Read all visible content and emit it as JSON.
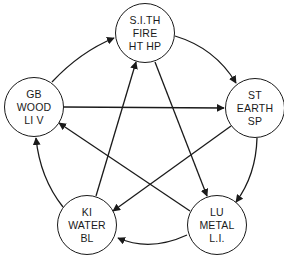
{
  "diagram": {
    "type": "five-element-cycle",
    "colors": {
      "stroke": "#1a1a1a",
      "background": "#ffffff"
    },
    "nodes": [
      {
        "id": "fire",
        "lines": [
          "S.I.TH",
          "FIRE",
          "HT HP"
        ],
        "cx": 145,
        "cy": 33,
        "r": 30
      },
      {
        "id": "earth",
        "lines": [
          "ST",
          "EARTH",
          "SP"
        ],
        "cx": 255,
        "cy": 108,
        "r": 30
      },
      {
        "id": "metal",
        "lines": [
          "LU",
          "METAL",
          "L.I."
        ],
        "cx": 217,
        "cy": 225,
        "r": 30
      },
      {
        "id": "water",
        "lines": [
          "KI",
          "WATER",
          "BL"
        ],
        "cx": 87,
        "cy": 225,
        "r": 30
      },
      {
        "id": "wood",
        "lines": [
          "GB",
          "WOOD",
          "LI V"
        ],
        "cx": 34,
        "cy": 107,
        "r": 30
      }
    ],
    "edges": [
      {
        "from": "wood",
        "to": "fire",
        "kind": "outer-cycle"
      },
      {
        "from": "fire",
        "to": "earth",
        "kind": "outer-cycle"
      },
      {
        "from": "earth",
        "to": "metal",
        "kind": "outer-cycle"
      },
      {
        "from": "metal",
        "to": "water",
        "kind": "outer-cycle"
      },
      {
        "from": "water",
        "to": "wood",
        "kind": "outer-cycle"
      },
      {
        "from": "wood",
        "to": "earth",
        "kind": "inner-star"
      },
      {
        "from": "fire",
        "to": "metal",
        "kind": "inner-star"
      },
      {
        "from": "earth",
        "to": "water",
        "kind": "inner-star"
      },
      {
        "from": "metal",
        "to": "wood",
        "kind": "inner-star"
      },
      {
        "from": "water",
        "to": "fire",
        "kind": "inner-star"
      }
    ]
  }
}
